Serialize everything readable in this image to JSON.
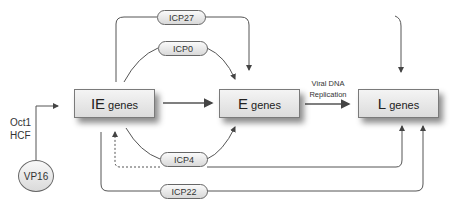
{
  "diagram": {
    "type": "gene regulatory cascade",
    "nodes": {
      "ie_genes": {
        "prefix": "IE",
        "suffix": "genes"
      },
      "e_genes": {
        "prefix": "E",
        "suffix": "genes"
      },
      "l_genes": {
        "prefix": "L",
        "suffix": "genes"
      },
      "vp16": {
        "label": "VP16"
      }
    },
    "regulators": {
      "icp27": "ICP27",
      "icp0": "ICP0",
      "icp4": "ICP4",
      "icp22": "ICP22"
    },
    "cofactors": {
      "line1": "Oct1",
      "line2": "HCF"
    },
    "edge_labels": {
      "e_to_l_line1": "Viral DNA",
      "e_to_l_line2": "Replication"
    },
    "edges": [
      {
        "from": "VP16",
        "to": "IE genes",
        "via": "Oct1/HCF"
      },
      {
        "from": "IE genes",
        "to": "E genes"
      },
      {
        "from": "E genes",
        "to": "L genes",
        "label": "Viral DNA Replication"
      },
      {
        "from": "IE genes",
        "via": "ICP27",
        "to": [
          "E genes",
          "L genes"
        ]
      },
      {
        "from": "IE genes",
        "via": "ICP0",
        "to": "E genes"
      },
      {
        "from": "IE genes",
        "via": "ICP4",
        "to": [
          "E genes",
          "L genes"
        ],
        "feedback": "IE genes (dashed)"
      },
      {
        "from": "IE genes",
        "via": "ICP22",
        "to": "L genes"
      }
    ]
  },
  "colors": {
    "line": "#555555",
    "box_fill_top": "#f4f4f4",
    "box_fill_bottom": "#dcdcdc"
  }
}
